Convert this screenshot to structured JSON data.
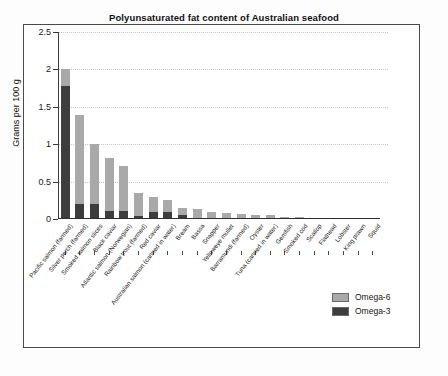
{
  "chart_data": {
    "type": "bar",
    "subtype": "stacked-bar",
    "title": "Polyunsaturated fat content of Australian seafood",
    "xlabel": "",
    "ylabel": "Grams per 100 g",
    "ylim": [
      0,
      2.5
    ],
    "yticks": [
      0,
      0.5,
      1,
      1.5,
      2,
      2.5
    ],
    "ytick_labels": [
      "0",
      "0.5",
      "1",
      "1.5",
      "2",
      "2.5"
    ],
    "grid": "horizontal-dotted",
    "legend_position": "bottom-right",
    "categories": [
      "Pacific salmon (farmed)",
      "Silver perch (farmed)",
      "Smoked salmon slices",
      "Black caviar",
      "Atlantic salmon (Norwegian)",
      "Rainbow trout (farmed)",
      "Red caviar",
      "Australian salmon (canned in water)",
      "Bream",
      "Bassa",
      "Snapper",
      "Yelloweye mullet",
      "Barramundi (farmed)",
      "Oyster",
      "Tuna (canned in water)",
      "Gemfish",
      "Smoked cod",
      "Scallop",
      "Flathead",
      "Lobster",
      "King prawn",
      "Squid"
    ],
    "series": [
      {
        "name": "Omega-3",
        "color": "#3d3d3d",
        "values": [
          1.78,
          0.2,
          0.2,
          0.11,
          0.11,
          0.04,
          0.09,
          0.09,
          0.05,
          0.02,
          0.02,
          0.02,
          0.02,
          0.02,
          0.02,
          0.01,
          0.01,
          0.01,
          0.0,
          0.0,
          0.0,
          0.0
        ]
      },
      {
        "name": "Omega-6",
        "color": "#a9a9a9",
        "values": [
          0.22,
          1.19,
          0.8,
          0.71,
          0.6,
          0.31,
          0.2,
          0.17,
          0.1,
          0.11,
          0.08,
          0.06,
          0.05,
          0.04,
          0.03,
          0.02,
          0.02,
          0.01,
          0.01,
          0.01,
          0.01,
          0.01
        ]
      }
    ],
    "totals": [
      2.0,
      1.39,
      1.0,
      0.82,
      0.71,
      0.35,
      0.29,
      0.26,
      0.15,
      0.13,
      0.1,
      0.08,
      0.07,
      0.06,
      0.05,
      0.03,
      0.03,
      0.02,
      0.01,
      0.01,
      0.01,
      0.01
    ]
  },
  "legend": {
    "items": [
      {
        "label": "Omega-6",
        "color": "#a9a9a9"
      },
      {
        "label": "Omega-3",
        "color": "#3d3d3d"
      }
    ]
  }
}
